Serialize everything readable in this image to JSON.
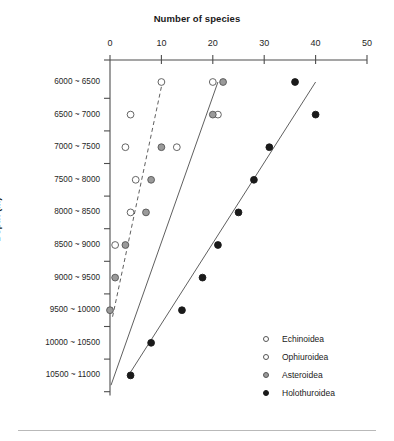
{
  "chart_data": {
    "type": "scatter",
    "title": "Number of species",
    "xlabel": "Number of species",
    "ylabel": "Depth (m)",
    "xlim": [
      0,
      50
    ],
    "xticks": [
      0,
      10,
      20,
      30,
      40,
      50
    ],
    "grid": false,
    "legend_position": "bottom-right",
    "categories": [
      "6000 ~ 6500",
      "6500 ~ 7000",
      "7000 ~ 7500",
      "7500 ~ 8000",
      "8000 ~ 8500",
      "8500 ~ 9000",
      "9000 ~ 9500",
      "9500 ~ 10000",
      "10000 ~ 10500",
      "10500 ~ 11000"
    ],
    "series": [
      {
        "name": "Echinoidea",
        "marker": "open-circle",
        "color": "#ffffff",
        "edge_color": "#555555",
        "trendline": "dashed",
        "values": [
          10,
          4,
          13,
          5,
          4,
          1,
          null,
          null,
          null,
          null
        ]
      },
      {
        "name": "Ophiuroidea",
        "marker": "open-circle",
        "color": "#ffffff",
        "edge_color": "#555555",
        "trendline": "none",
        "values": [
          20,
          21,
          3,
          null,
          null,
          null,
          null,
          null,
          null,
          null
        ]
      },
      {
        "name": "Asteroidea",
        "marker": "gray-circle",
        "color": "#9a9a9a",
        "edge_color": "#555555",
        "trendline": "solid",
        "values": [
          22,
          20,
          10,
          8,
          7,
          3,
          1,
          0,
          null,
          null
        ]
      },
      {
        "name": "Holothuroidea",
        "marker": "filled-circle",
        "color": "#1a1a1a",
        "edge_color": "#1a1a1a",
        "trendline": "solid",
        "values": [
          36,
          40,
          31,
          28,
          25,
          21,
          18,
          14,
          8,
          4
        ]
      }
    ],
    "trendlines": [
      {
        "series": "Echinoidea",
        "style": "dashed",
        "x1": 0.5,
        "row1": 7.2,
        "x2": 10.2,
        "row2": 0.0
      },
      {
        "series": "Asteroidea",
        "style": "solid",
        "x1": 0.2,
        "row1": 9.3,
        "x2": 21.0,
        "row2": 0.0
      },
      {
        "series": "Holothuroidea",
        "style": "solid",
        "x1": 3.6,
        "row1": 9.0,
        "x2": 40.0,
        "row2": 0.0
      }
    ]
  },
  "legend": {
    "items": [
      {
        "label": "Echinoidea",
        "marker": "open-circle"
      },
      {
        "label": "Ophiuroidea",
        "marker": "open-circle"
      },
      {
        "label": "Asteroidea",
        "marker": "gray-circle"
      },
      {
        "label": "Holothuroidea",
        "marker": "filled-circle"
      }
    ]
  },
  "axes": {
    "x_title": "Number of species",
    "y_title": "Depth (m)",
    "x_tick_labels": [
      "0",
      "10",
      "20",
      "30",
      "40",
      "50"
    ],
    "y_tick_labels": [
      "6000 ~ 6500",
      "6500 ~ 7000",
      "7000 ~ 7500",
      "7500 ~ 8000",
      "8000 ~ 8500",
      "8500 ~ 9000",
      "9000 ~ 9500",
      "9500 ~ 10000",
      "10000 ~ 10500",
      "10500 ~ 11000"
    ]
  }
}
